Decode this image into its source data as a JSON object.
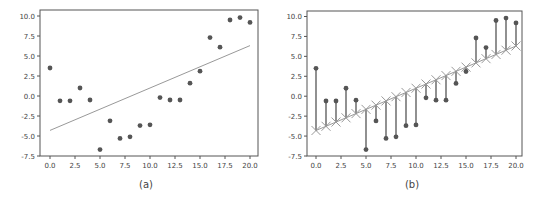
{
  "figure": {
    "panels": [
      {
        "id": "a",
        "caption": "(a)"
      },
      {
        "id": "b",
        "caption": "(b)"
      }
    ]
  },
  "chart_data": [
    {
      "type": "scatter",
      "title": "",
      "caption": "(a)",
      "xlabel": "",
      "ylabel": "",
      "xlim": [
        -1,
        20.8
      ],
      "ylim": [
        -7.5,
        10.75
      ],
      "xticks": [
        0.0,
        2.5,
        5.0,
        7.5,
        10.0,
        12.5,
        15.0,
        17.5,
        20.0
      ],
      "xtick_labels": [
        "0.0",
        "2.5",
        "5.0",
        "7.5",
        "10.0",
        "12.5",
        "15.0",
        "17.5",
        "20.0"
      ],
      "yticks": [
        -7.5,
        -5.0,
        -2.5,
        0.0,
        2.5,
        5.0,
        7.5,
        10.0
      ],
      "ytick_labels": [
        "-7.5",
        "-5.0",
        "-2.5",
        "0.0",
        "2.5",
        "5.0",
        "7.5",
        "10.0"
      ],
      "grid": false,
      "legend": null,
      "series": [
        {
          "name": "data points",
          "kind": "scatter",
          "color": "#555555",
          "x": [
            0,
            1,
            2,
            3,
            4,
            5,
            6,
            7,
            8,
            9,
            10,
            11,
            12,
            13,
            14,
            15,
            16,
            17,
            18,
            19,
            20
          ],
          "y": [
            3.5,
            -0.6,
            -0.6,
            1.0,
            -0.5,
            -6.7,
            -3.1,
            -5.3,
            -5.1,
            -3.7,
            -3.6,
            -0.2,
            -0.5,
            -0.5,
            1.6,
            3.1,
            7.3,
            6.1,
            9.5,
            9.8,
            9.2
          ]
        },
        {
          "name": "linear fit",
          "kind": "line",
          "color": "#999999",
          "x": [
            0,
            20
          ],
          "y": [
            -4.3,
            6.3
          ]
        }
      ]
    },
    {
      "type": "scatter",
      "title": "",
      "caption": "(b)",
      "xlabel": "",
      "ylabel": "",
      "xlim": [
        -1,
        20.8
      ],
      "ylim": [
        -7.5,
        10.75
      ],
      "xticks": [
        0.0,
        2.5,
        5.0,
        7.5,
        10.0,
        12.5,
        15.0,
        17.5,
        20.0
      ],
      "xtick_labels": [
        "0.0",
        "2.5",
        "5.0",
        "7.5",
        "10.0",
        "12.5",
        "15.0",
        "17.5",
        "20.0"
      ],
      "yticks": [
        -7.5,
        -5.0,
        -2.5,
        0.0,
        2.5,
        5.0,
        7.5,
        10.0
      ],
      "ytick_labels": [
        "-7.5",
        "-5.0",
        "-2.5",
        "0.0",
        "2.5",
        "5.0",
        "7.5",
        "10.0"
      ],
      "grid": false,
      "legend": null,
      "series": [
        {
          "name": "data points",
          "kind": "scatter",
          "color": "#555555",
          "x": [
            0,
            1,
            2,
            3,
            4,
            5,
            6,
            7,
            8,
            9,
            10,
            11,
            12,
            13,
            14,
            15,
            16,
            17,
            18,
            19,
            20
          ],
          "y": [
            3.5,
            -0.6,
            -0.6,
            1.0,
            -0.5,
            -6.7,
            -3.1,
            -5.3,
            -5.1,
            -3.7,
            -3.6,
            -0.2,
            -0.5,
            -0.5,
            1.6,
            3.1,
            7.3,
            6.1,
            9.5,
            9.8,
            9.2
          ]
        },
        {
          "name": "predicted values (x markers on fit line)",
          "kind": "line+marker",
          "marker": "x",
          "color": "#999999",
          "x": [
            0,
            1,
            2,
            3,
            4,
            5,
            6,
            7,
            8,
            9,
            10,
            11,
            12,
            13,
            14,
            15,
            16,
            17,
            18,
            19,
            20
          ],
          "y": [
            -4.3,
            -3.77,
            -3.24,
            -2.71,
            -2.18,
            -1.65,
            -1.12,
            -0.59,
            -0.06,
            0.47,
            1.0,
            1.53,
            2.06,
            2.59,
            3.12,
            3.65,
            4.18,
            4.71,
            5.24,
            5.77,
            6.3
          ]
        },
        {
          "name": "residuals",
          "kind": "vlines",
          "color": "#555555",
          "description": "vertical segments from each predicted value to its data point"
        }
      ]
    }
  ]
}
